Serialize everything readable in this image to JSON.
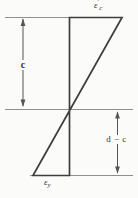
{
  "figure": {
    "type": "strain-distribution-diagram",
    "colors": {
      "background": "#fbfbf9",
      "profile_line": "#3e3e3e",
      "reference_line": "#8f8f8f",
      "dimension_line": "#555555",
      "text": "#333333"
    },
    "labels": {
      "top_strain": {
        "base": "ε",
        "prime": "′",
        "sub": "c"
      },
      "bottom_strain": {
        "base": "ε",
        "sub": "y"
      },
      "left_dim": "c",
      "right_dim": "d − c"
    }
  }
}
